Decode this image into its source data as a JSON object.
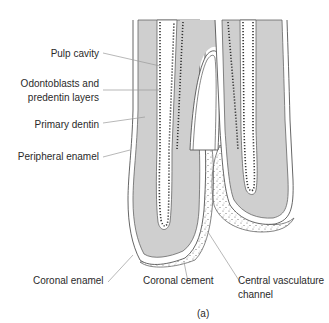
{
  "figure": {
    "caption": "(a)",
    "colors": {
      "dentin": "#cfcfcf",
      "outline": "#555555",
      "dots": "#444444",
      "cement_dots": "#666666",
      "leader": "#9a9a9a",
      "background": "#ffffff"
    },
    "labels": {
      "pulp_cavity": "Pulp cavity",
      "odontoblasts_line1": "Odontoblasts and",
      "odontoblasts_line2": "predentin layers",
      "primary_dentin": "Primary dentin",
      "peripheral_enamel": "Peripheral enamel",
      "coronal_enamel": "Coronal enamel",
      "coronal_cement": "Coronal cement",
      "central_vasculature_line1": "Central vasculature",
      "central_vasculature_line2": "channel"
    }
  }
}
